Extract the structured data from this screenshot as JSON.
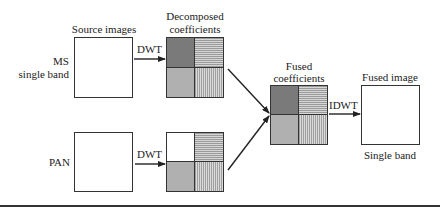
{
  "diagram": {
    "title_labels": {
      "source_images": "Source images",
      "decomposed_line1": "Decomposed",
      "decomposed_line2": "coefficients",
      "fused_coeff_line1": "Fused",
      "fused_coeff_line2": "coefficients",
      "fused_image": "Fused image",
      "fused_image_caption": "Single band"
    },
    "inputs": [
      {
        "label_line1": "MS",
        "label_line2": "single band",
        "transform": "DWT"
      },
      {
        "label_line1": "PAN",
        "label_line2": "",
        "transform": "DWT"
      }
    ],
    "output_transform": "IDWT",
    "coefficient_patterns": {
      "ms": [
        "dark",
        "horizontal-lines",
        "dotted",
        "vertical-lines"
      ],
      "pan": [
        "white",
        "horizontal-lines",
        "dotted",
        "vertical-lines"
      ],
      "fused": [
        "dark",
        "horizontal-lines",
        "dotted",
        "vertical-lines"
      ]
    },
    "colors": {
      "stroke": "#333333",
      "dark_fill": "#7a7a7a",
      "dotted_fill": "#b0b0b0"
    }
  }
}
